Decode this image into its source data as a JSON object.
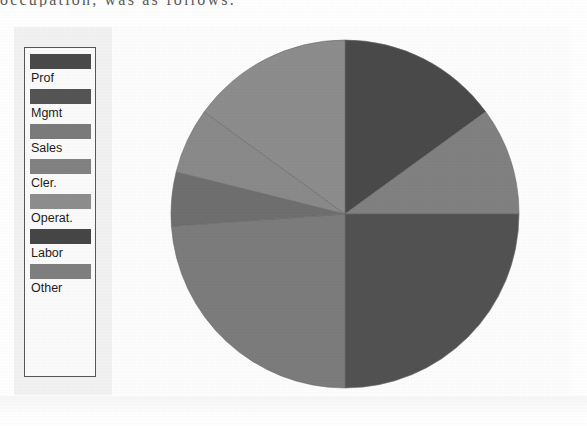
{
  "figure": {
    "scan_header_text": "occupation, was as follows:",
    "background_color": "#fdfdfd",
    "panel_color": "#f2f2f2"
  },
  "legend": {
    "name": "pie-legend",
    "border_color": "#575757",
    "items": [
      {
        "label": "Prof",
        "color": "#4a4a4a",
        "swatch_name": "legend-swatch-prof"
      },
      {
        "label": "Mgmt",
        "color": "#555555",
        "swatch_name": "legend-swatch-mgmt"
      },
      {
        "label": "Sales",
        "color": "#7b7b7b",
        "swatch_name": "legend-swatch-sales"
      },
      {
        "label": "Cler.",
        "color": "#828282",
        "swatch_name": "legend-swatch-cler"
      },
      {
        "label": "Operat.",
        "color": "#8e8e8e",
        "swatch_name": "legend-swatch-operat"
      },
      {
        "label": "Labor",
        "color": "#464646",
        "swatch_name": "legend-swatch-labor"
      },
      {
        "label": "Other",
        "color": "#7f7f7f",
        "swatch_name": "legend-swatch-other"
      }
    ]
  },
  "chart_data": {
    "type": "pie",
    "title": "",
    "xlabel": "",
    "ylabel": "",
    "legend_position": "left",
    "grid": false,
    "start_angle_deg": 0,
    "direction": "clockwise",
    "center": {
      "x": 175,
      "y": 181
    },
    "radius": 174,
    "categories": [
      "Prof",
      "Mgmt",
      "Sales",
      "Cler.",
      "Operat.",
      "Labor",
      "Other"
    ],
    "values": [
      15.0,
      10.0,
      25.0,
      24.0,
      5.0,
      6.0,
      15.0
    ],
    "units": "percent",
    "slices": [
      {
        "label": "Prof",
        "value": 15.0,
        "color": "#4a4a4a",
        "start_deg": 0.0,
        "end_deg": 54.0
      },
      {
        "label": "Mgmt",
        "value": 10.0,
        "color": "#818181",
        "start_deg": 54.0,
        "end_deg": 90.0
      },
      {
        "label": "Sales",
        "value": 25.0,
        "color": "#525252",
        "start_deg": 90.0,
        "end_deg": 180.0
      },
      {
        "label": "Cler.",
        "value": 24.0,
        "color": "#7c7c7c",
        "start_deg": 180.0,
        "end_deg": 266.0
      },
      {
        "label": "Operat.",
        "value": 5.0,
        "color": "#6f6f6f",
        "start_deg": 266.0,
        "end_deg": 284.0
      },
      {
        "label": "Labor",
        "value": 6.0,
        "color": "#8a8a8a",
        "start_deg": 284.0,
        "end_deg": 306.0
      },
      {
        "label": "Other",
        "value": 15.0,
        "color": "#8d8d8d",
        "start_deg": 306.0,
        "end_deg": 360.0
      }
    ]
  }
}
